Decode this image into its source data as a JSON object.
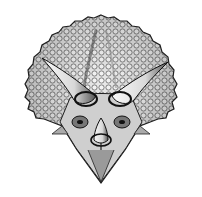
{
  "image": {
    "subject": "Triceratops head, frontal view",
    "style": "black and white pen-and-ink illustration",
    "background": "#ffffff",
    "ink": "#1a1a1a",
    "features": [
      "frill",
      "left-brow-horn",
      "right-brow-horn",
      "nasal-horn",
      "beak",
      "eyes"
    ]
  }
}
